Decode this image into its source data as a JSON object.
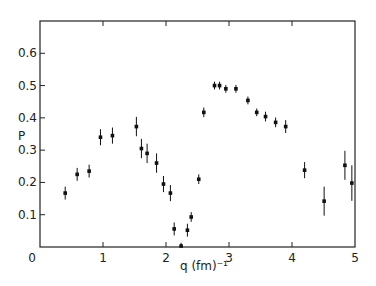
{
  "chart_data": {
    "type": "scatter",
    "title": "",
    "xlabel": "q (fm)⁻¹",
    "ylabel": "P",
    "xlim": [
      0,
      5
    ],
    "ylim": [
      0,
      0.7
    ],
    "xticks": [
      0,
      1,
      2,
      3,
      4,
      5
    ],
    "xtick_labels": [
      "0",
      "1",
      "2",
      "3",
      "4",
      "5"
    ],
    "yticks": [
      0,
      0.1,
      0.2,
      0.3,
      0.4,
      0.5,
      0.6
    ],
    "ytick_labels": [
      "0",
      "0.1",
      "0.2",
      "0.3",
      "0.4",
      "0.5",
      "0.6"
    ],
    "grid": false,
    "legend": null,
    "error_bars": true,
    "series": [
      {
        "name": "P",
        "x": [
          0.4,
          0.59,
          0.78,
          0.96,
          1.15,
          1.53,
          1.61,
          1.7,
          1.85,
          1.96,
          2.07,
          2.13,
          2.24,
          2.34,
          2.4,
          2.52,
          2.6,
          2.77,
          2.85,
          2.95,
          3.11,
          3.3,
          3.44,
          3.58,
          3.74,
          3.9,
          4.2,
          4.51,
          4.84,
          4.95
        ],
        "y": [
          0.167,
          0.225,
          0.235,
          0.34,
          0.345,
          0.373,
          0.305,
          0.29,
          0.26,
          0.195,
          0.167,
          0.056,
          0.003,
          0.052,
          0.093,
          0.21,
          0.417,
          0.5,
          0.5,
          0.49,
          0.49,
          0.454,
          0.417,
          0.404,
          0.386,
          0.373,
          0.238,
          0.142,
          0.253,
          0.198
        ],
        "yerr": [
          0.02,
          0.02,
          0.02,
          0.025,
          0.025,
          0.03,
          0.03,
          0.03,
          0.03,
          0.025,
          0.025,
          0.02,
          0.01,
          0.02,
          0.015,
          0.015,
          0.015,
          0.012,
          0.012,
          0.012,
          0.012,
          0.012,
          0.012,
          0.015,
          0.015,
          0.02,
          0.025,
          0.045,
          0.045,
          0.055
        ]
      }
    ]
  }
}
